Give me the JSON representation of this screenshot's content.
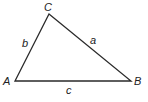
{
  "diagram": {
    "type": "triangle",
    "stroke_color": "#2a2a2a",
    "vertices": {
      "A": {
        "label": "A",
        "x": 15,
        "y": 81
      },
      "B": {
        "label": "B",
        "x": 131,
        "y": 81
      },
      "C": {
        "label": "C",
        "x": 49,
        "y": 14
      }
    },
    "sides": {
      "a": {
        "label": "a",
        "between": [
          "B",
          "C"
        ]
      },
      "b": {
        "label": "b",
        "between": [
          "A",
          "C"
        ]
      },
      "c": {
        "label": "c",
        "between": [
          "A",
          "B"
        ]
      }
    }
  }
}
